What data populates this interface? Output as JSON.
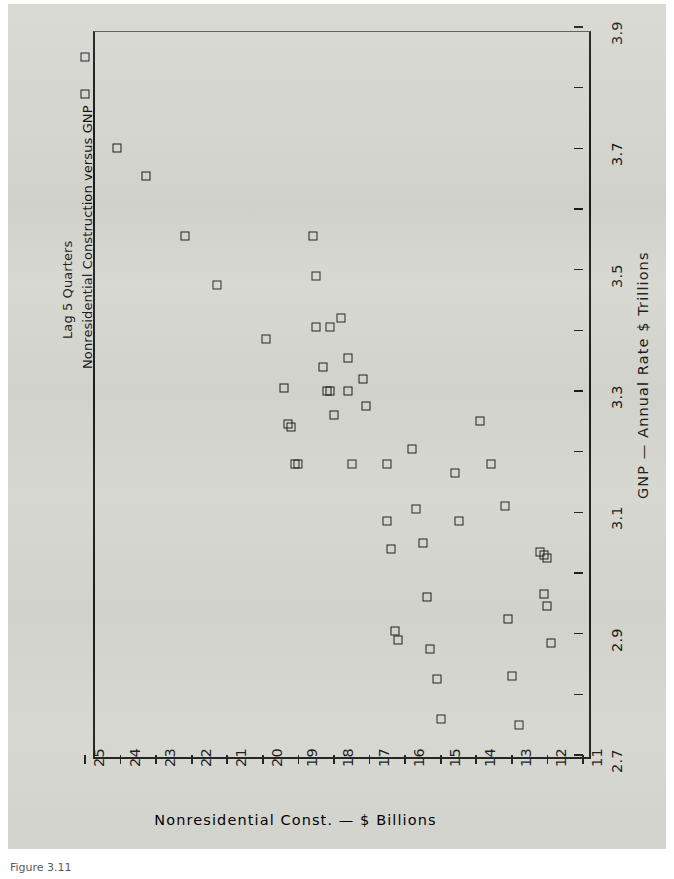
{
  "figure": {
    "title_line1": "Nonresidential Construction versus GNP",
    "title_line2": "Lag 5 Quarters",
    "caption": "Figure 3.11"
  },
  "chart_data": {
    "type": "scatter",
    "title": "Nonresidential Construction versus GNP",
    "subtitle": "Lag 5 Quarters",
    "orientation": "page rotated 90 degrees (landscape plot printed sideways)",
    "xlabel": "Nonresidential Const. — $ Billions",
    "ylabel": "GNP — Annual Rate $ Trillions",
    "xlim": [
      25,
      11
    ],
    "ylim": [
      2.7,
      3.9
    ],
    "x_inverted": true,
    "xticks": [
      25,
      24,
      23,
      22,
      21,
      20,
      19,
      18,
      17,
      16,
      15,
      14,
      13,
      12,
      11
    ],
    "xticklabels": [
      "25",
      "24",
      "23",
      "22",
      "21",
      "20",
      "19",
      "18",
      "17",
      "16",
      "15",
      "14",
      "13",
      "12",
      "11"
    ],
    "yticks": [
      2.7,
      2.8,
      2.9,
      3.0,
      3.1,
      3.2,
      3.3,
      3.4,
      3.5,
      3.6,
      3.7,
      3.8,
      3.9
    ],
    "yticklabels": [
      "2.7",
      "",
      "2.9",
      "",
      "3.1",
      "",
      "3.3",
      "",
      "3.5",
      "",
      "3.7",
      "",
      "3.9"
    ],
    "grid": false,
    "legend": false,
    "marker": "open-square",
    "marker_color": "#1d1d1d",
    "points": [
      {
        "x": 25.0,
        "y": 3.85
      },
      {
        "x": 25.0,
        "y": 3.79
      },
      {
        "x": 24.1,
        "y": 3.7
      },
      {
        "x": 23.3,
        "y": 3.655
      },
      {
        "x": 22.2,
        "y": 3.555
      },
      {
        "x": 21.3,
        "y": 3.475
      },
      {
        "x": 19.9,
        "y": 3.385
      },
      {
        "x": 19.4,
        "y": 3.305
      },
      {
        "x": 19.3,
        "y": 3.245
      },
      {
        "x": 19.2,
        "y": 3.24
      },
      {
        "x": 19.1,
        "y": 3.18
      },
      {
        "x": 19.0,
        "y": 3.18
      },
      {
        "x": 18.6,
        "y": 3.555
      },
      {
        "x": 18.5,
        "y": 3.49
      },
      {
        "x": 18.5,
        "y": 3.405
      },
      {
        "x": 18.1,
        "y": 3.405
      },
      {
        "x": 18.3,
        "y": 3.34
      },
      {
        "x": 18.2,
        "y": 3.3
      },
      {
        "x": 18.1,
        "y": 3.3
      },
      {
        "x": 18.0,
        "y": 3.26
      },
      {
        "x": 17.8,
        "y": 3.42
      },
      {
        "x": 17.6,
        "y": 3.355
      },
      {
        "x": 17.6,
        "y": 3.3
      },
      {
        "x": 17.5,
        "y": 3.18
      },
      {
        "x": 17.2,
        "y": 3.32
      },
      {
        "x": 17.1,
        "y": 3.275
      },
      {
        "x": 16.5,
        "y": 3.18
      },
      {
        "x": 16.5,
        "y": 3.085
      },
      {
        "x": 16.4,
        "y": 3.04
      },
      {
        "x": 16.3,
        "y": 2.905
      },
      {
        "x": 16.2,
        "y": 2.89
      },
      {
        "x": 15.8,
        "y": 3.205
      },
      {
        "x": 15.7,
        "y": 3.105
      },
      {
        "x": 15.5,
        "y": 3.05
      },
      {
        "x": 15.4,
        "y": 2.96
      },
      {
        "x": 15.3,
        "y": 2.875
      },
      {
        "x": 15.1,
        "y": 2.825
      },
      {
        "x": 15.0,
        "y": 2.76
      },
      {
        "x": 14.6,
        "y": 3.165
      },
      {
        "x": 14.5,
        "y": 3.085
      },
      {
        "x": 13.9,
        "y": 3.25
      },
      {
        "x": 13.6,
        "y": 3.18
      },
      {
        "x": 13.2,
        "y": 3.11
      },
      {
        "x": 13.1,
        "y": 2.925
      },
      {
        "x": 13.0,
        "y": 2.83
      },
      {
        "x": 12.8,
        "y": 2.75
      },
      {
        "x": 12.2,
        "y": 3.035
      },
      {
        "x": 12.1,
        "y": 3.03
      },
      {
        "x": 12.0,
        "y": 3.025
      },
      {
        "x": 12.1,
        "y": 2.965
      },
      {
        "x": 12.0,
        "y": 2.945
      },
      {
        "x": 11.9,
        "y": 2.885
      }
    ]
  }
}
